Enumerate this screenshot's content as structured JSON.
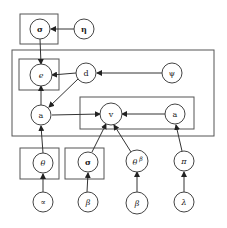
{
  "diagram": {
    "type": "plate-notation graphical model",
    "nodes": {
      "sigma_top": {
        "label": "σ",
        "x": 40,
        "y": 29
      },
      "eta": {
        "label": "η",
        "x": 84,
        "y": 29
      },
      "e": {
        "label": "e",
        "x": 41,
        "y": 75
      },
      "d": {
        "label": "d",
        "x": 86,
        "y": 73
      },
      "psi": {
        "label": "ψ",
        "x": 172,
        "y": 73
      },
      "a_left": {
        "label": "a",
        "x": 41,
        "y": 115
      },
      "v": {
        "label": "v",
        "x": 111,
        "y": 114
      },
      "a_right": {
        "label": "a",
        "x": 175,
        "y": 114
      },
      "theta": {
        "label": "θ",
        "x": 43,
        "y": 163
      },
      "sigma_bottom": {
        "label": "σ",
        "x": 88,
        "y": 162
      },
      "theta_beta": {
        "label": "θ",
        "sup": "β",
        "x": 137,
        "y": 161
      },
      "pi": {
        "label": "π",
        "x": 184,
        "y": 161
      },
      "alpha": {
        "label": "∝",
        "x": 43,
        "y": 202
      },
      "beta1": {
        "label": "β",
        "x": 88,
        "y": 202
      },
      "beta2": {
        "label": "β",
        "x": 137,
        "y": 203
      },
      "lambda": {
        "label": "λ",
        "x": 184,
        "y": 202
      }
    },
    "edges": [
      [
        "eta",
        "sigma_top"
      ],
      [
        "sigma_top",
        "e"
      ],
      [
        "d",
        "e"
      ],
      [
        "psi",
        "d"
      ],
      [
        "d",
        "a_left"
      ],
      [
        "a_left",
        "e"
      ],
      [
        "a_left",
        "v"
      ],
      [
        "a_right",
        "v"
      ],
      [
        "theta",
        "a_left"
      ],
      [
        "sigma_bottom",
        "v"
      ],
      [
        "theta_beta",
        "v"
      ],
      [
        "pi",
        "a_right"
      ],
      [
        "alpha",
        "theta"
      ],
      [
        "beta1",
        "sigma_bottom"
      ],
      [
        "beta2",
        "theta_beta"
      ],
      [
        "lambda",
        "pi"
      ]
    ]
  }
}
